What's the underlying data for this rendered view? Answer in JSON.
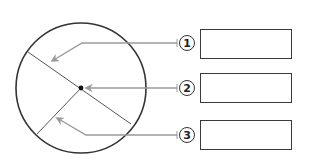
{
  "diagram": {
    "type": "circle-parts-labeling",
    "circle": {
      "cx": 81,
      "cy": 88,
      "r": 65,
      "stroke": "#333333"
    },
    "center_point": {
      "x": 81,
      "y": 88
    },
    "diameter": {
      "x1": 28,
      "y1": 52,
      "x2": 131,
      "y2": 124
    },
    "radius": {
      "x1": 81,
      "y1": 88,
      "x2": 37,
      "y2": 134
    },
    "leader_color": "#9a9a9a",
    "labels": [
      {
        "number": "1",
        "target": "circumference-region",
        "box_value": ""
      },
      {
        "number": "2",
        "target": "center",
        "box_value": ""
      },
      {
        "number": "3",
        "target": "radius-region",
        "box_value": ""
      }
    ]
  }
}
